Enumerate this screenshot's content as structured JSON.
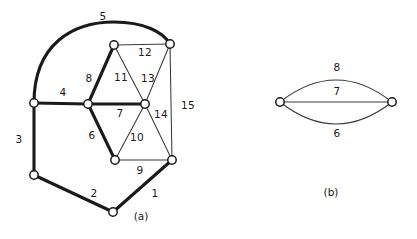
{
  "figure": {
    "background_color": "#ffffff",
    "stroke_color": "#1a1a1a",
    "thin_stroke_color": "#3a3a3a",
    "panels": [
      {
        "caption": "(a)",
        "caption_pos": {
          "x": 141,
          "y": 216
        },
        "nodes": [
          {
            "id": "n-left-mid",
            "x": 34,
            "y": 103,
            "r": 4.2
          },
          {
            "id": "n-left-low",
            "x": 34,
            "y": 175,
            "r": 4.2
          },
          {
            "id": "n-bottom",
            "x": 113,
            "y": 212,
            "r": 4.2
          },
          {
            "id": "n-center",
            "x": 88,
            "y": 104,
            "r": 4.2
          },
          {
            "id": "n-top-left",
            "x": 114,
            "y": 45,
            "r": 4.2
          },
          {
            "id": "n-top-right",
            "x": 170,
            "y": 44,
            "r": 4.2
          },
          {
            "id": "n-right-mid",
            "x": 145,
            "y": 104,
            "r": 4.2
          },
          {
            "id": "n-bottom-mid",
            "x": 115,
            "y": 160,
            "r": 4.2
          },
          {
            "id": "n-bottom-right",
            "x": 172,
            "y": 160,
            "r": 4.2
          }
        ],
        "edges": [
          {
            "label": "1",
            "from": "n-bottom",
            "to": "n-bottom-right",
            "weight": "thick",
            "shape": "line",
            "label_pos": {
              "x": 155,
              "y": 193
            }
          },
          {
            "label": "2",
            "from": "n-left-low",
            "to": "n-bottom",
            "weight": "thick",
            "shape": "line",
            "label_pos": {
              "x": 94,
              "y": 193
            }
          },
          {
            "label": "3",
            "from": "n-left-mid",
            "to": "n-left-low",
            "weight": "thick",
            "shape": "line",
            "label_pos": {
              "x": 19,
              "y": 139
            }
          },
          {
            "label": "4",
            "from": "n-left-mid",
            "to": "n-center",
            "weight": "thick",
            "shape": "line",
            "label_pos": {
              "x": 63,
              "y": 92
            }
          },
          {
            "label": "5",
            "from": "n-left-mid",
            "to": "n-top-right",
            "weight": "thick",
            "shape": "arc",
            "label_pos": {
              "x": 103,
              "y": 16
            }
          },
          {
            "label": "6",
            "from": "n-center",
            "to": "n-bottom-mid",
            "weight": "thick",
            "shape": "line",
            "label_pos": {
              "x": 92,
              "y": 135
            }
          },
          {
            "label": "7",
            "from": "n-center",
            "to": "n-right-mid",
            "weight": "thick",
            "shape": "line",
            "label_pos": {
              "x": 120,
              "y": 113
            }
          },
          {
            "label": "8",
            "from": "n-center",
            "to": "n-top-left",
            "weight": "thick",
            "shape": "line",
            "label_pos": {
              "x": 89,
              "y": 78
            }
          },
          {
            "label": "9",
            "from": "n-bottom-mid",
            "to": "n-bottom-right",
            "weight": "thin",
            "shape": "line",
            "label_pos": {
              "x": 140,
              "y": 170
            }
          },
          {
            "label": "10",
            "from": "n-bottom-mid",
            "to": "n-right-mid",
            "weight": "thin",
            "shape": "line",
            "label_pos": {
              "x": 137,
              "y": 137
            }
          },
          {
            "label": "11",
            "from": "n-top-left",
            "to": "n-right-mid",
            "weight": "thin",
            "shape": "line",
            "label_pos": {
              "x": 121,
              "y": 77
            }
          },
          {
            "label": "12",
            "from": "n-top-left",
            "to": "n-top-right",
            "weight": "thin",
            "shape": "line",
            "label_pos": {
              "x": 145,
              "y": 52
            }
          },
          {
            "label": "13",
            "from": "n-top-right",
            "to": "n-right-mid",
            "weight": "thin",
            "shape": "line",
            "label_pos": {
              "x": 148,
              "y": 78
            }
          },
          {
            "label": "14",
            "from": "n-right-mid",
            "to": "n-bottom-right",
            "weight": "thin",
            "shape": "line",
            "label_pos": {
              "x": 161,
              "y": 114
            }
          },
          {
            "label": "15",
            "from": "n-top-right",
            "to": "n-bottom-right",
            "weight": "thin",
            "shape": "line",
            "label_pos": {
              "x": 188,
              "y": 105
            }
          }
        ]
      },
      {
        "caption": "(b)",
        "caption_pos": {
          "x": 331,
          "y": 192
        },
        "nodes": [
          {
            "id": "b-left",
            "x": 280,
            "y": 102,
            "r": 4.2
          },
          {
            "id": "b-right",
            "x": 392,
            "y": 102,
            "r": 4.2
          }
        ],
        "edges": [
          {
            "label": "8",
            "from": "b-left",
            "to": "b-right",
            "weight": "thin",
            "shape": "arc-up",
            "label_pos": {
              "x": 337,
              "y": 67
            }
          },
          {
            "label": "7",
            "from": "b-left",
            "to": "b-right",
            "weight": "thin",
            "shape": "line",
            "label_pos": {
              "x": 337,
              "y": 91
            }
          },
          {
            "label": "6",
            "from": "b-left",
            "to": "b-right",
            "weight": "thin",
            "shape": "arc-down",
            "label_pos": {
              "x": 337,
              "y": 133
            }
          }
        ]
      }
    ]
  }
}
